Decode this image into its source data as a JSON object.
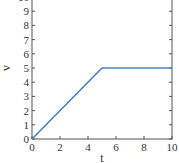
{
  "chart_data": {
    "type": "line",
    "title": "",
    "xlabel": "t",
    "ylabel": "v",
    "xlim": [
      0,
      10
    ],
    "ylim": [
      0,
      10
    ],
    "xticks": [
      0,
      2,
      4,
      6,
      8,
      10
    ],
    "yticks": [
      0,
      1,
      2,
      3,
      4,
      5,
      6,
      7,
      8,
      9,
      10
    ],
    "grid": false,
    "legend": null,
    "series": [
      {
        "name": "v(t)",
        "color": "#4a7fc1",
        "x": [
          0,
          5,
          10
        ],
        "y": [
          0,
          5,
          5
        ]
      }
    ]
  },
  "layout": {
    "plot_left": 32,
    "plot_right": 172,
    "plot_bottom": 139,
    "px_per_y": 14.2,
    "frame_color": "#555555",
    "text_color": "#333333"
  }
}
